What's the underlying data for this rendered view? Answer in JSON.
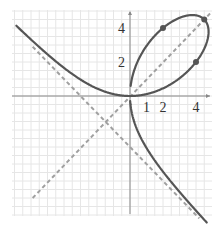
{
  "chart_data": {
    "type": "line",
    "title": "",
    "xlabel": "",
    "ylabel": "",
    "equation": "x^3 + y^3 = 9xy",
    "xlim": [
      -7,
      5
    ],
    "ylim": [
      -7.5,
      5
    ],
    "grid": true,
    "grid_step": 0.5,
    "x_tick_labels": [
      {
        "value": 1,
        "label": "1"
      },
      {
        "value": 2,
        "label": "2"
      },
      {
        "value": 4,
        "label": "4"
      }
    ],
    "y_tick_labels": [
      {
        "value": 2,
        "label": "2"
      },
      {
        "value": 4,
        "label": "4"
      }
    ],
    "series": [
      {
        "name": "folium",
        "style": "solid",
        "color": "#555555",
        "param": {
          "x": "9t/(1+t^3)",
          "y": "9t^2/(1+t^3)"
        },
        "branches": [
          {
            "t_start": -0.6,
            "t_end": 15
          },
          {
            "t_start": -1.6,
            "t_end": -30
          }
        ]
      },
      {
        "name": "symmetry line y = x",
        "style": "dashed",
        "color": "#999999",
        "points": [
          [
            -5.9,
            -6.0
          ],
          [
            4.85,
            4.85
          ]
        ]
      },
      {
        "name": "asymptote x + y = -3",
        "style": "dashed",
        "color": "#999999",
        "points": [
          [
            -5.9,
            2.9
          ],
          [
            4.2,
            -7.2
          ]
        ]
      }
    ],
    "highlight_points": [
      {
        "x": 2,
        "y": 4
      },
      {
        "x": 4.5,
        "y": 4.5
      },
      {
        "x": 4,
        "y": 2
      }
    ]
  },
  "colors": {
    "curve": "#555555",
    "dashed": "#a0a0a0",
    "axis": "#888888",
    "grid": "#e6e6e6",
    "point": "#555555"
  }
}
